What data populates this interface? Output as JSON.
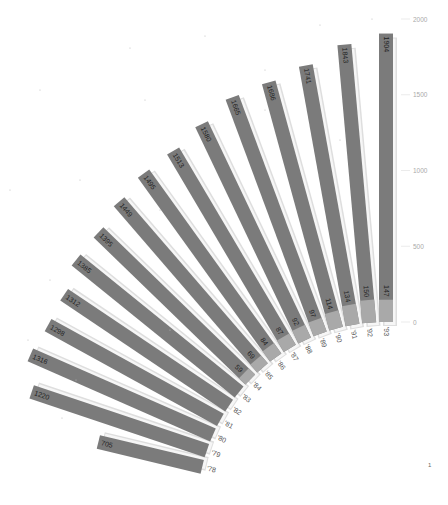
{
  "chart_data": {
    "type": "radial-bar",
    "title": "",
    "xlabel": "",
    "ylabel": "",
    "categories": [
      "'78",
      "'79",
      "'80",
      "'81",
      "'82",
      "'83",
      "'84",
      "'85",
      "'86",
      "'87",
      "'88",
      "'89",
      "'90",
      "'91",
      "'92",
      "'93"
    ],
    "series": [
      {
        "name": "total",
        "values": [
          705,
          1220,
          1316,
          1298,
          1312,
          1385,
          1395,
          1449,
          1495,
          1513,
          1580,
          1665,
          1686,
          1741,
          1843,
          1904
        ]
      },
      {
        "name": "inner",
        "values": [
          null,
          null,
          null,
          null,
          null,
          null,
          59,
          69,
          84,
          87,
          92,
          97,
          114,
          134,
          150,
          147
        ]
      }
    ],
    "axis": {
      "ticks": [
        0,
        500,
        1000,
        1500,
        2000
      ],
      "ylim": [
        0,
        2000
      ]
    },
    "grid": false,
    "legend": null
  },
  "colors": {
    "bar": "#7b7b7b",
    "inner": "#a9a9a9",
    "shadow": "#dedede",
    "text": "#222222"
  },
  "corner_mark": "1"
}
